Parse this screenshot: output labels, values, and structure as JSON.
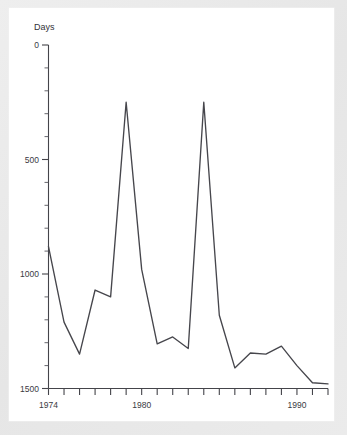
{
  "figure": {
    "background_color": "#e9e9e9",
    "panel_color": "#ffffff",
    "line_color": "#46464c",
    "axis_color": "#44444a"
  },
  "axis": {
    "ylabel": "Days",
    "y_ticks": [
      "1500",
      "1000",
      "500",
      "0"
    ],
    "x_ticks": [
      "1974",
      "1980",
      "1990"
    ]
  },
  "chart_data": {
    "type": "line",
    "title": "",
    "xlabel": "",
    "ylabel": "Days",
    "ylim": [
      0,
      1500
    ],
    "xlim": [
      1974,
      1992
    ],
    "grid": false,
    "legend": null,
    "y_tick_values": [
      0,
      500,
      1000,
      1500
    ],
    "y_minor_tick_step": 100,
    "x_tick_values": [
      1974,
      1975,
      1976,
      1977,
      1978,
      1979,
      1980,
      1981,
      1982,
      1983,
      1984,
      1985,
      1986,
      1987,
      1988,
      1989,
      1990,
      1991,
      1992
    ],
    "x_labeled_ticks": [
      1974,
      1980,
      1990
    ],
    "x": [
      1974,
      1975,
      1976,
      1977,
      1978,
      1979,
      1980,
      1981,
      1982,
      1983,
      1984,
      1985,
      1986,
      1987,
      1988,
      1989,
      1990,
      1991,
      1992
    ],
    "values": [
      620,
      290,
      150,
      430,
      400,
      1250,
      520,
      195,
      225,
      175,
      1250,
      320,
      90,
      155,
      150,
      185,
      100,
      25,
      20
    ],
    "series": [
      {
        "name": "Days",
        "values": [
          620,
          290,
          150,
          430,
          400,
          1250,
          520,
          195,
          225,
          175,
          1250,
          320,
          90,
          155,
          150,
          185,
          100,
          25,
          20
        ]
      }
    ]
  }
}
